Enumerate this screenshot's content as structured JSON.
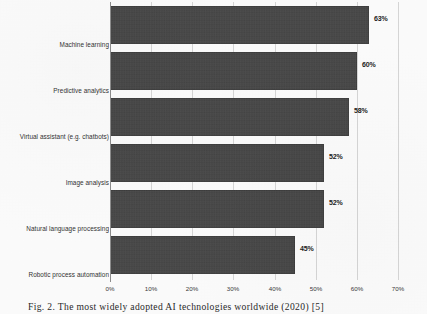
{
  "figure": {
    "caption": "Fig. 2. The most widely adopted AI technologies worldwide (2020) [5]"
  },
  "chart_data": {
    "type": "bar",
    "orientation": "horizontal",
    "title": "",
    "xlabel": "",
    "ylabel": "",
    "xlim": [
      0,
      70
    ],
    "grid": true,
    "legend": false,
    "value_suffix": "%",
    "categories": [
      "Machine learning",
      "Predictive analytics",
      "Virtual assistant (e.g. chatbots)",
      "Image analysis",
      "Natural language processing",
      "Robotic process automation"
    ],
    "values": [
      63,
      60,
      58,
      52,
      52,
      45
    ],
    "value_labels": [
      "63%",
      "60%",
      "58%",
      "52%",
      "52%",
      "45%"
    ],
    "xticks": [
      0,
      10,
      20,
      30,
      40,
      50,
      60,
      70
    ],
    "xtick_labels": [
      "0%",
      "10%",
      "20%",
      "30%",
      "40%",
      "50%",
      "60%",
      "70%"
    ],
    "bar_color": "#434343",
    "gridline_color": "#d7d7d7",
    "axis_color": "#8e8e8e",
    "background_color": "#fdfdfd"
  }
}
